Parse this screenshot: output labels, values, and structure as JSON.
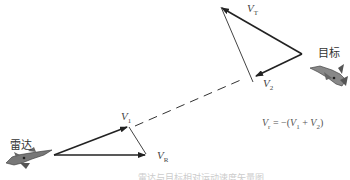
{
  "diagram": {
    "radar_label": "雷达",
    "target_label": "目标",
    "vectors": {
      "v1": {
        "symbol": "V",
        "sub": "1"
      },
      "v2": {
        "symbol": "V",
        "sub": "2"
      },
      "vr": {
        "symbol": "V",
        "sub": "R"
      },
      "vt": {
        "symbol": "V",
        "sub": "T"
      }
    },
    "formula": "Vₜ = −(V₁ + V₂)",
    "formula_parts": {
      "lhs": "V",
      "lhs_sub": "r",
      "eq": " = −(",
      "t1": "V",
      "t1_sub": "1",
      "plus": " + ",
      "t2": "V",
      "t2_sub": "2",
      "close": ")"
    },
    "caption": "雷达与目标相对运动速度矢量图",
    "colors": {
      "line": "#222222",
      "thin_line": "#444444",
      "aircraft": "#555555"
    }
  }
}
